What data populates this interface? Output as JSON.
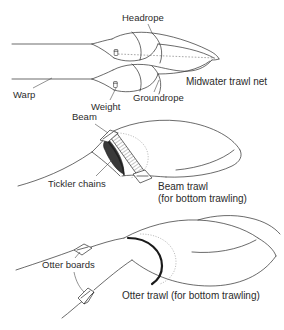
{
  "figure": {
    "title_visible": false,
    "background_color": "#ffffff",
    "line_color": "#2b2b2b",
    "text_color": "#2b2b2b",
    "panels": [
      {
        "id": "midwater",
        "caption": "Midwater trawl net",
        "labels": [
          {
            "name": "headrope",
            "text": "Headrope"
          },
          {
            "name": "warp",
            "text": "Warp"
          },
          {
            "name": "weight",
            "text": "Weight"
          },
          {
            "name": "groundrope",
            "text": "Groundrope"
          }
        ]
      },
      {
        "id": "beam",
        "caption_line1": "Beam trawl",
        "caption_line2": "(for bottom trawling)",
        "labels": [
          {
            "name": "beam",
            "text": "Beam"
          },
          {
            "name": "tickler-chains",
            "text": "Tickler chains"
          }
        ]
      },
      {
        "id": "otter",
        "caption": "Otter trawl (for bottom trawling)",
        "labels": [
          {
            "name": "otter-boards",
            "text": "Otter boards"
          }
        ]
      }
    ]
  },
  "labels": {
    "headrope": "Headrope",
    "warp": "Warp",
    "weight": "Weight",
    "groundrope": "Groundrope",
    "midwater_caption": "Midwater trawl net",
    "beam": "Beam",
    "tickler_chains": "Tickler chains",
    "beam_caption_1": "Beam trawl",
    "beam_caption_2": "(for bottom trawling)",
    "otter_boards": "Otter boards",
    "otter_caption": "Otter trawl (for bottom trawling)"
  }
}
